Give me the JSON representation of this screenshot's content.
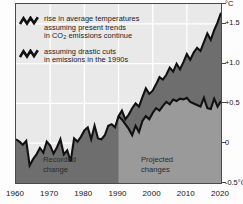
{
  "chart_data": {
    "type": "area",
    "title": "",
    "subtitle": "",
    "xlabel": "",
    "ylabel": "°C",
    "xlim": [
      1960,
      2020
    ],
    "ylim": [
      -0.5,
      1.75
    ],
    "grid": true,
    "legend_position": "top-left",
    "x_ticks": [
      "1960",
      "1970",
      "1980",
      "1990",
      "2000",
      "2010",
      "2020"
    ],
    "x_tick_values": [
      1960,
      1970,
      1980,
      1990,
      2000,
      2010,
      2020
    ],
    "y_ticks": [
      "°C",
      "+1.5",
      "+1.0",
      "+0.5",
      "0",
      "-0.5°C"
    ],
    "y_tick_values": [
      1.75,
      1.5,
      1.0,
      0.5,
      0.0,
      -0.5
    ],
    "y_axis_unit": "°C",
    "divergence_year": 1990,
    "series": [
      {
        "name": "rise in average temperatures assuming present trends in CO2 emissions continue",
        "fill": "#6e6e6e",
        "line": "#111111",
        "x": [
          1960,
          1961,
          1962,
          1963,
          1964,
          1965,
          1966,
          1967,
          1968,
          1969,
          1970,
          1971,
          1972,
          1973,
          1974,
          1975,
          1976,
          1977,
          1978,
          1979,
          1980,
          1981,
          1982,
          1983,
          1984,
          1985,
          1986,
          1987,
          1988,
          1989,
          1990,
          1991,
          1992,
          1993,
          1994,
          1995,
          1996,
          1997,
          1998,
          1999,
          2000,
          2001,
          2002,
          2003,
          2004,
          2005,
          2006,
          2007,
          2008,
          2009,
          2010,
          2011,
          2012,
          2013,
          2014,
          2015,
          2016,
          2017,
          2018,
          2019,
          2020
        ],
        "values": [
          0.05,
          0.02,
          -0.02,
          0.03,
          -0.28,
          -0.2,
          -0.14,
          -0.06,
          -0.12,
          0.02,
          -0.03,
          -0.13,
          -0.05,
          0.05,
          -0.14,
          -0.09,
          -0.23,
          0.06,
          0.02,
          0.08,
          0.16,
          0.2,
          0.05,
          0.22,
          0.06,
          0.05,
          0.1,
          0.22,
          0.24,
          0.2,
          0.34,
          0.41,
          0.3,
          0.36,
          0.44,
          0.5,
          0.46,
          0.58,
          0.69,
          0.62,
          0.66,
          0.74,
          0.83,
          0.8,
          0.86,
          0.95,
          0.9,
          1.0,
          0.93,
          1.02,
          1.12,
          1.05,
          1.14,
          1.2,
          1.16,
          1.27,
          1.38,
          1.3,
          1.42,
          1.52,
          1.64
        ]
      },
      {
        "name": "assuming drastic cuts in emissions in the 1990s",
        "fill": "#9a9a9a",
        "line": "#111111",
        "x": [
          1990,
          1991,
          1992,
          1993,
          1994,
          1995,
          1996,
          1997,
          1998,
          1999,
          2000,
          2001,
          2002,
          2003,
          2004,
          2005,
          2006,
          2007,
          2008,
          2009,
          2010,
          2011,
          2012,
          2013,
          2014,
          2015,
          2016,
          2017,
          2018,
          2019,
          2020
        ],
        "values": [
          0.34,
          0.3,
          0.24,
          0.18,
          0.1,
          0.22,
          0.14,
          0.28,
          0.34,
          0.3,
          0.38,
          0.44,
          0.41,
          0.47,
          0.52,
          0.49,
          0.55,
          0.53,
          0.56,
          0.55,
          0.57,
          0.52,
          0.5,
          0.48,
          0.46,
          0.57,
          0.44,
          0.43,
          0.56,
          0.46,
          0.53
        ]
      }
    ]
  },
  "legend": {
    "items": [
      {
        "glyph": "zigzag-line-icon",
        "line1": "rise in average temperatures",
        "line2": "assuming present trends",
        "line3_pre": "in CO",
        "line3_sub": "2",
        "line3_post": " emissions continue"
      },
      {
        "glyph": "zigzag-line-icon",
        "line1": "assuming drastic cuts",
        "line2": "in emissions in the 1990s",
        "line3_pre": "",
        "line3_sub": "",
        "line3_post": ""
      }
    ]
  },
  "annotations": {
    "recorded": "Recorded\nchange",
    "projected": "Projected\nchanges"
  },
  "colors": {
    "frame": "#4a4a4a",
    "plot_background": "#e9e9e9",
    "gridline": "#ffffff",
    "upper_band": "#6e6e6e",
    "lower_band": "#9a9a9a",
    "curve": "#111111",
    "page_background": "#fdfdfd",
    "text": "#151515"
  }
}
